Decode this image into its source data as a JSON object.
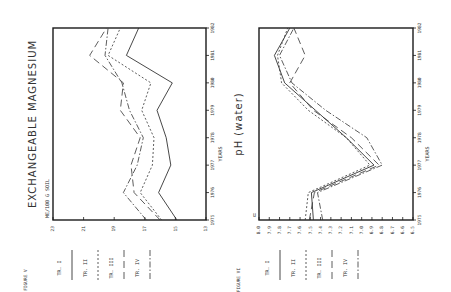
{
  "chart_data": [
    {
      "type": "line",
      "figure_label": "FIGURE V",
      "title": "EXCHANGEABLE MAGNESIUM",
      "ylabel": "ME/100 G SOIL",
      "xlabel": "YEARS",
      "orientation": "rotated 90° counter-clockwise",
      "x": [
        1975,
        1976,
        1977,
        1978,
        1979,
        1980,
        1981,
        1982
      ],
      "x_ticks": [
        "1975",
        "1976",
        "1977",
        "1978",
        "1979",
        "1980",
        "1981",
        "1982"
      ],
      "y_ticks": [
        "23",
        "21",
        "19",
        "17",
        "15",
        "13"
      ],
      "ylim": [
        13,
        23
      ],
      "grid": false,
      "legend_position": "below plot (rotated)",
      "series": [
        {
          "name": "TR. I",
          "style": "solid",
          "values": [
            14.9,
            16.1,
            15.3,
            15.6,
            16.2,
            15.2,
            18.2,
            17.4
          ]
        },
        {
          "name": "TR. II",
          "style": "dotted",
          "values": [
            15.9,
            17.3,
            16.5,
            16.4,
            17.2,
            16.6,
            19.4,
            18.6
          ]
        },
        {
          "name": "TR. III",
          "style": "dashed",
          "values": [
            16.0,
            17.7,
            17.9,
            17.3,
            18.6,
            18.4,
            20.6,
            19.5
          ]
        },
        {
          "name": "TR. IV",
          "style": "dash-dot",
          "values": [
            16.9,
            18.4,
            17.5,
            17.1,
            18.0,
            18.5,
            19.6,
            19.4
          ]
        }
      ]
    },
    {
      "type": "line",
      "figure_label": "FIGURE VI",
      "title": "pH (water)",
      "ylabel": "",
      "xlabel": "YEARS",
      "orientation": "rotated 90° counter-clockwise",
      "x": [
        1975,
        1976,
        1977,
        1978,
        1979,
        1980,
        1981,
        1982
      ],
      "x_ticks": [
        "1975",
        "1976",
        "1977",
        "1978",
        "1979",
        "1980",
        "1981",
        "1982"
      ],
      "y_ticks": [
        "8.0",
        "7.9",
        "7.8",
        "7.7",
        "7.6",
        "7.5",
        "7.4",
        "7.3",
        "7.2",
        "7.1",
        "7.0",
        "6.9",
        "6.8",
        "6.7",
        "6.6",
        "6.5"
      ],
      "y_axis_corner_label": "U",
      "ylim": [
        6.5,
        8.0
      ],
      "grid": false,
      "legend_position": "below plot (rotated)",
      "series": [
        {
          "name": "TR. I",
          "style": "solid",
          "values": [
            7.47,
            7.49,
            6.88,
            7.15,
            7.45,
            7.75,
            7.85,
            7.7
          ]
        },
        {
          "name": "TR. II",
          "style": "dotted",
          "values": [
            7.55,
            7.52,
            6.92,
            7.15,
            7.52,
            7.78,
            7.82,
            7.72
          ]
        },
        {
          "name": "TR. III",
          "style": "dashed",
          "values": [
            7.51,
            7.46,
            6.83,
            7.1,
            7.47,
            7.7,
            7.55,
            7.66
          ]
        },
        {
          "name": "TR. IV",
          "style": "dash-dot",
          "values": [
            7.38,
            7.43,
            6.8,
            6.95,
            7.35,
            7.68,
            7.8,
            7.66
          ]
        }
      ]
    }
  ]
}
